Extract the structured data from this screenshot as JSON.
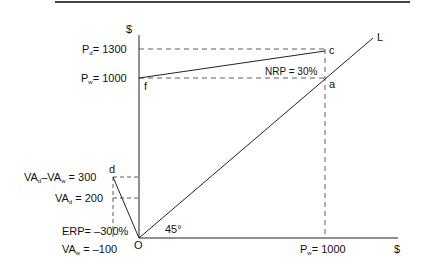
{
  "diagram": {
    "y_axis_unit": "$",
    "x_axis_unit": "$",
    "origin_label": "O",
    "angle_label": "45°",
    "line_label": "L",
    "points": {
      "c": "c",
      "f": "f",
      "a": "a",
      "d": "d"
    },
    "y_labels": {
      "pd": {
        "main": "P",
        "sub": "d",
        "value": "= 1300"
      },
      "pw": {
        "main": "P",
        "sub": "w",
        "value": "= 1000"
      },
      "va_diff": {
        "a": "VA",
        "a_sub": "d",
        "sep": "–",
        "b": "VA",
        "b_sub": "w",
        "value": " =  300"
      },
      "vad": {
        "main": "VA",
        "sub": "d",
        "value": " = 200"
      },
      "erp": "ERP= –300%",
      "vaw": {
        "main": "VA",
        "sub": "w",
        "value": " = –100"
      }
    },
    "x_labels": {
      "pw": {
        "main": "P",
        "sub": "w",
        "value": "= 1000"
      }
    },
    "nrp_label": "NRP = 30%",
    "colors": {
      "line": "#222222",
      "dash": "#333333",
      "rule": "#444444"
    }
  }
}
